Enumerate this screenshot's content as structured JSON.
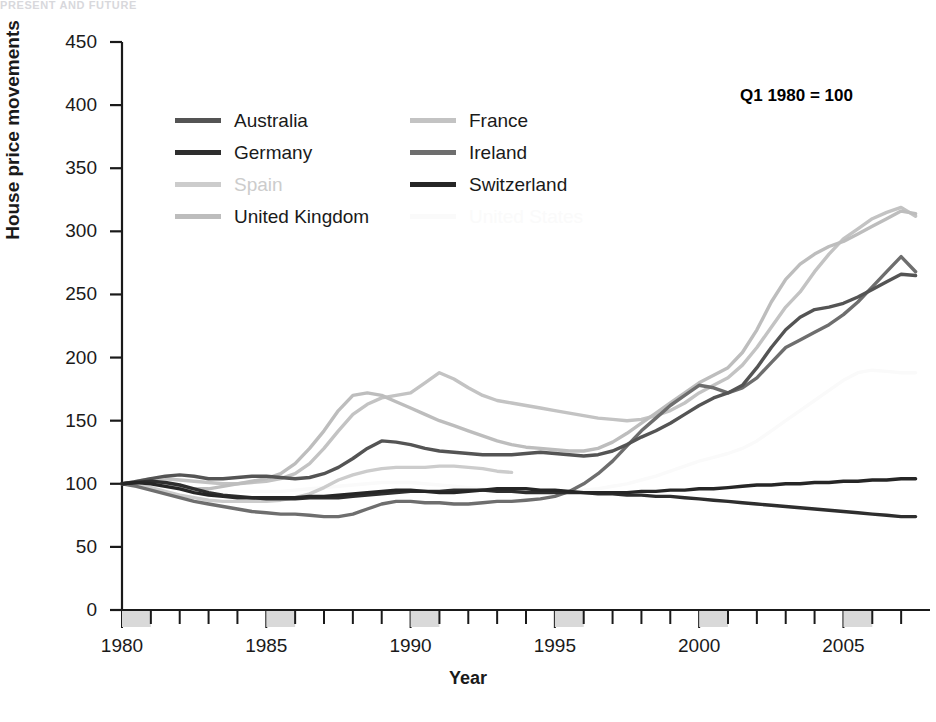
{
  "page": {
    "header_fragment": "PRESENT AND FUTURE"
  },
  "annotation": {
    "text": "Q1 1980 = 100",
    "x": 740,
    "y": 86
  },
  "legend": {
    "rows": [
      [
        {
          "label": "Australia",
          "color": "#545454"
        },
        {
          "label": "France",
          "color": "#c3c3c3"
        }
      ],
      [
        {
          "label": "Germany",
          "color": "#2e2e2e"
        },
        {
          "label": "Ireland",
          "color": "#6e6e6e"
        }
      ],
      [
        {
          "label": "Spain",
          "color": "#cccccc"
        },
        {
          "label": "Switzerland",
          "color": "#262626"
        }
      ],
      [
        {
          "label": "United Kingdom",
          "color": "#bdbdbd"
        },
        {
          "label": "United States",
          "color": "#fafafa"
        }
      ]
    ]
  },
  "chart_data": {
    "type": "line",
    "title": "",
    "xlabel": "Year",
    "ylabel": "House price movements",
    "xlim": [
      1980,
      2008
    ],
    "ylim": [
      0,
      450
    ],
    "ytick_step": 50,
    "yticks": [
      0,
      50,
      100,
      150,
      200,
      250,
      300,
      350,
      400,
      450
    ],
    "xticks_major": [
      1980,
      1985,
      1990,
      1995,
      2000,
      2005
    ],
    "xtick_minor_step": 1,
    "grid": false,
    "legend_position": "upper-left-inside",
    "base_note": "Q1 1980 = 100",
    "x": [
      1980,
      1980.5,
      1981,
      1981.5,
      1982,
      1982.5,
      1983,
      1983.5,
      1984,
      1984.5,
      1985,
      1985.5,
      1986,
      1986.5,
      1987,
      1987.5,
      1988,
      1988.5,
      1989,
      1989.5,
      1990,
      1990.5,
      1991,
      1991.5,
      1992,
      1992.5,
      1993,
      1993.5,
      1994,
      1994.5,
      1995,
      1995.5,
      1996,
      1996.5,
      1997,
      1997.5,
      1998,
      1998.5,
      1999,
      1999.5,
      2000,
      2000.5,
      2001,
      2001.5,
      2002,
      2002.5,
      2003,
      2003.5,
      2004,
      2004.5,
      2005,
      2005.5,
      2006,
      2006.5,
      2007,
      2007.5
    ],
    "series": [
      {
        "name": "Australia",
        "color": "#545454",
        "values": [
          100,
          102,
          104,
          106,
          107,
          106,
          104,
          104,
          105,
          106,
          106,
          105,
          104,
          105,
          108,
          113,
          120,
          128,
          134,
          133,
          131,
          128,
          126,
          125,
          124,
          123,
          123,
          123,
          124,
          125,
          124,
          123,
          122,
          123,
          126,
          131,
          137,
          142,
          148,
          155,
          162,
          168,
          172,
          178,
          192,
          208,
          222,
          232,
          238,
          240,
          243,
          248,
          254,
          260,
          266,
          265
        ]
      },
      {
        "name": "Germany",
        "color": "#2e2e2e",
        "values": [
          100,
          101,
          102,
          101,
          99,
          96,
          93,
          91,
          90,
          89,
          88,
          88,
          88,
          89,
          89,
          89,
          90,
          91,
          92,
          93,
          94,
          94,
          94,
          95,
          95,
          95,
          94,
          94,
          93,
          93,
          93,
          93,
          93,
          92,
          92,
          91,
          91,
          90,
          90,
          89,
          88,
          87,
          86,
          85,
          84,
          83,
          82,
          81,
          80,
          79,
          78,
          77,
          76,
          75,
          74,
          74
        ]
      },
      {
        "name": "Spain",
        "color": "#cccccc",
        "values": [
          100,
          99,
          97,
          94,
          91,
          89,
          87,
          86,
          86,
          86,
          86,
          87,
          89,
          92,
          97,
          103,
          107,
          110,
          112,
          113,
          113,
          113,
          114,
          114,
          113,
          112,
          110,
          109,
          null,
          null,
          null,
          null,
          null,
          null,
          null,
          null,
          null,
          null,
          null,
          null,
          null,
          null,
          null,
          null,
          null,
          null,
          null,
          null,
          null,
          null,
          null,
          null,
          null,
          null,
          null,
          null
        ]
      },
      {
        "name": "United Kingdom",
        "color": "#bdbdbd",
        "values": [
          100,
          101,
          101,
          99,
          97,
          96,
          96,
          98,
          100,
          102,
          104,
          108,
          116,
          128,
          142,
          158,
          170,
          172,
          170,
          165,
          160,
          155,
          150,
          146,
          142,
          138,
          134,
          131,
          129,
          128,
          127,
          126,
          126,
          128,
          133,
          140,
          148,
          156,
          164,
          172,
          180,
          186,
          192,
          204,
          222,
          244,
          262,
          274,
          282,
          288,
          292,
          298,
          304,
          310,
          316,
          314
        ]
      },
      {
        "name": "France",
        "color": "#c3c3c3",
        "values": [
          100,
          102,
          104,
          104,
          103,
          102,
          101,
          100,
          100,
          101,
          102,
          104,
          108,
          116,
          128,
          142,
          155,
          163,
          168,
          170,
          172,
          180,
          188,
          183,
          176,
          170,
          166,
          164,
          162,
          160,
          158,
          156,
          154,
          152,
          151,
          150,
          151,
          154,
          158,
          164,
          172,
          178,
          184,
          194,
          208,
          224,
          240,
          252,
          268,
          282,
          294,
          302,
          310,
          315,
          319,
          312
        ]
      },
      {
        "name": "Ireland",
        "color": "#6e6e6e",
        "values": [
          100,
          98,
          95,
          92,
          89,
          86,
          84,
          82,
          80,
          78,
          77,
          76,
          76,
          75,
          74,
          74,
          76,
          80,
          84,
          86,
          86,
          85,
          85,
          84,
          84,
          85,
          86,
          86,
          87,
          88,
          90,
          94,
          100,
          108,
          118,
          130,
          142,
          152,
          162,
          170,
          178,
          176,
          172,
          176,
          184,
          196,
          208,
          214,
          220,
          226,
          234,
          244,
          256,
          268,
          280,
          268
        ]
      },
      {
        "name": "Switzerland",
        "color": "#262626",
        "values": [
          100,
          101,
          100,
          98,
          96,
          93,
          91,
          90,
          89,
          89,
          89,
          89,
          89,
          90,
          90,
          91,
          92,
          93,
          94,
          95,
          95,
          94,
          93,
          93,
          94,
          95,
          96,
          96,
          96,
          95,
          95,
          94,
          93,
          93,
          93,
          93,
          94,
          94,
          95,
          95,
          96,
          96,
          97,
          98,
          99,
          99,
          100,
          100,
          101,
          101,
          102,
          102,
          103,
          103,
          104,
          104
        ]
      },
      {
        "name": "United States",
        "color": "#fafafa",
        "values": [
          100,
          100,
          99,
          98,
          96,
          95,
          94,
          94,
          94,
          94,
          94,
          94,
          95,
          96,
          97,
          98,
          99,
          100,
          101,
          101,
          101,
          100,
          99,
          98,
          97,
          96,
          95,
          95,
          94,
          94,
          94,
          94,
          95,
          96,
          98,
          100,
          103,
          106,
          110,
          114,
          118,
          121,
          124,
          128,
          134,
          142,
          150,
          158,
          166,
          174,
          182,
          188,
          190,
          189,
          188,
          188
        ]
      }
    ]
  }
}
